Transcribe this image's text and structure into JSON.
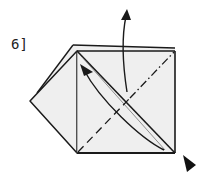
{
  "step": {
    "label": "6]",
    "number": 6
  },
  "colors": {
    "paper": "#efefef",
    "line": "#1a1a1a",
    "background": "#ffffff"
  },
  "symbols": {
    "valley_fold": "dashed diagonal line",
    "mountain_fold": "dash-dot diagonal line",
    "fold_arrow": "curved arrow toward top-left corner",
    "flip_arrow": "curved arrow pointing up",
    "push_arrow": "filled triangle at bottom-right corner"
  }
}
